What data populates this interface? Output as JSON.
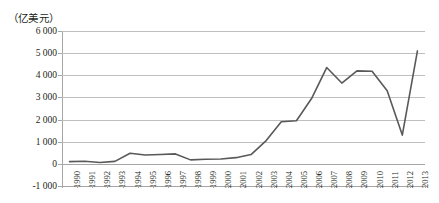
{
  "chart_data": {
    "type": "line",
    "title": "",
    "subtitle": "",
    "xlabel": "",
    "ylabel": "（亿美元）",
    "unit_caption": "（亿美元）",
    "grid": true,
    "legend": "none",
    "ylim": [
      -1000,
      6000
    ],
    "ytick_values": [
      6000,
      5000,
      4000,
      3000,
      2000,
      1000,
      0,
      -1000
    ],
    "ytick_labels": [
      "6 000",
      "5 000",
      "4 000",
      "3 000",
      "2 000",
      "1 000",
      "0",
      "-1 000"
    ],
    "categories": [
      "1990",
      "1991",
      "1992",
      "1993",
      "1994",
      "1995",
      "1996",
      "1997",
      "1998",
      "1999",
      "2000",
      "2001",
      "2002",
      "2003",
      "2004",
      "2005",
      "2006",
      "2007",
      "2008",
      "2009",
      "2010",
      "2011",
      "2012",
      "2013"
    ],
    "series": [
      {
        "name": "",
        "color": "#595959",
        "values": [
          100,
          120,
          60,
          110,
          480,
          400,
          420,
          450,
          180,
          210,
          220,
          280,
          420,
          1050,
          1900,
          1950,
          2950,
          4350,
          3650,
          4200,
          4180,
          3300,
          1300,
          5100
        ]
      }
    ]
  },
  "axis": {
    "y_unit": "（亿美元）",
    "ytick_labels": [
      "6 000",
      "5 000",
      "4 000",
      "3 000",
      "2 000",
      "1 000",
      "0",
      "-1 000"
    ],
    "xtick_labels": [
      "1990",
      "1991",
      "1992",
      "1993",
      "1994",
      "1995",
      "1996",
      "1997",
      "1998",
      "1999",
      "2000",
      "2001",
      "2002",
      "2003",
      "2004",
      "2005",
      "2006",
      "2007",
      "2008",
      "2009",
      "2010",
      "2011",
      "2012",
      "2013"
    ]
  },
  "colors": {
    "line": "#595959",
    "grid": "#bfbfbf",
    "axis": "#a6a6a6",
    "text": "#231f20",
    "background": "#ffffff"
  }
}
